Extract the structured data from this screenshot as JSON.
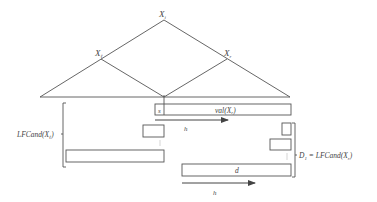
{
  "diagram": {
    "colors": {
      "line": "#555555",
      "text": "#444444",
      "background": "#ffffff"
    },
    "tree": {
      "root": {
        "label": "X",
        "sub": "i"
      },
      "left_child": {
        "label": "X",
        "sub": "ℓ"
      },
      "right_child": {
        "label": "X",
        "sub": "r"
      }
    },
    "top_bar": {
      "s_label": "s",
      "val_label": "val(X",
      "val_sub": "r",
      "val_close": ")"
    },
    "arrow_top": {
      "label": "h"
    },
    "arrow_bottom": {
      "label": "h"
    },
    "left_brace": {
      "label": "LFCand(X",
      "sub": "ℓ",
      "close": ")"
    },
    "right_brace": {
      "prefix": "D",
      "prefix_sub": "1",
      "eq": " = ",
      "label": "LFCand(X",
      "sub": "r",
      "close": ")"
    },
    "d_bar": {
      "label": "d"
    }
  }
}
